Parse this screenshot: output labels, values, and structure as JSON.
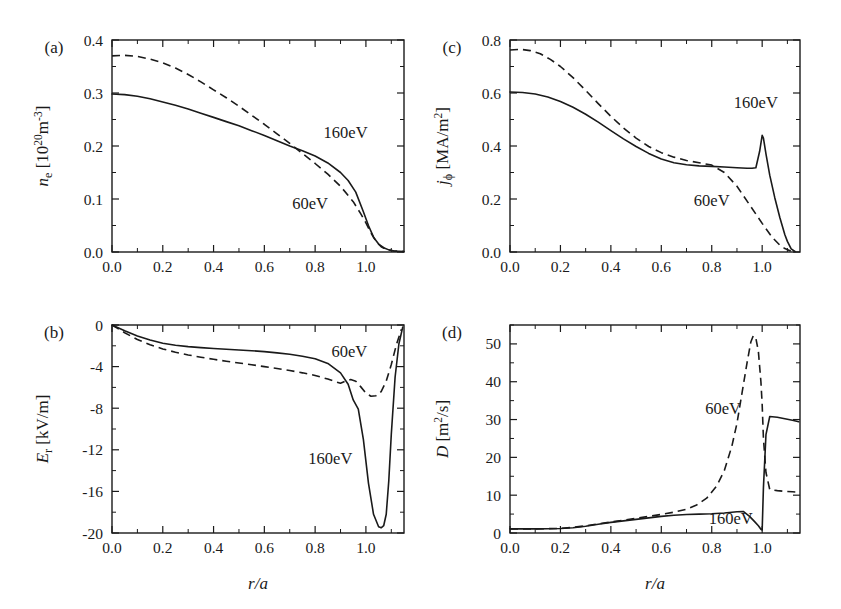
{
  "figure": {
    "panels": [
      {
        "id": "a",
        "letter": "(a)",
        "ylabel_main": "n",
        "ylabel_sub": "e",
        "ylabel_unit": " [10",
        "ylabel_unit_sup1": "20",
        "ylabel_unit_mid": "m",
        "ylabel_unit_sup2": "-3",
        "ylabel_unit_end": "]",
        "xlabel": "",
        "yticks": [
          "0.0",
          "0.1",
          "0.2",
          "0.3",
          "0.4"
        ],
        "xticks": [
          "0.0",
          "0.2",
          "0.4",
          "0.6",
          "0.8",
          "1.0"
        ],
        "labels": [
          {
            "text": "160eV",
            "x": 0.92,
            "y": 0.215
          },
          {
            "text": "60eV",
            "x": 0.78,
            "y": 0.082
          }
        ]
      },
      {
        "id": "b",
        "letter": "(b)",
        "ylabel_main": "E",
        "ylabel_sub": "r",
        "ylabel_unit": " [kV/m]",
        "xlabel": "r/a",
        "yticks": [
          "-20",
          "-16",
          "-12",
          "-8",
          "-4",
          "0"
        ],
        "xticks": [
          "0.0",
          "0.2",
          "0.4",
          "0.6",
          "0.8",
          "1.0"
        ],
        "labels": [
          {
            "text": "60eV",
            "x": 0.935,
            "y": -3.1
          },
          {
            "text": "160eV",
            "x": 0.86,
            "y": -13.4
          }
        ]
      },
      {
        "id": "c",
        "letter": "(c)",
        "ylabel_main": "j",
        "ylabel_sub": "ϕ",
        "ylabel_unit": " [MA/m",
        "ylabel_unit_sup1": "2",
        "ylabel_unit_end": "]",
        "xlabel": "",
        "yticks": [
          "0.0",
          "0.2",
          "0.4",
          "0.6",
          "0.8"
        ],
        "xticks": [
          "0.0",
          "0.2",
          "0.4",
          "0.6",
          "0.8",
          "1.0"
        ],
        "labels": [
          {
            "text": "160eV",
            "x": 0.975,
            "y": 0.545
          },
          {
            "text": "60eV",
            "x": 0.8,
            "y": 0.175
          }
        ]
      },
      {
        "id": "d",
        "letter": "(d)",
        "ylabel_main": "D",
        "ylabel_sub": "",
        "ylabel_unit": " [m",
        "ylabel_unit_sup1": "2",
        "ylabel_unit_end": "/s]",
        "xlabel": "r/a",
        "yticks": [
          "0",
          "10",
          "20",
          "30",
          "40",
          "50"
        ],
        "xticks": [
          "0.0",
          "0.2",
          "0.4",
          "0.6",
          "0.8",
          "1.0"
        ],
        "labels": [
          {
            "text": "60eV",
            "x": 0.845,
            "y": 31.5
          },
          {
            "text": "160eV",
            "x": 0.875,
            "y": 2.4
          }
        ]
      }
    ]
  },
  "chart_data": [
    {
      "type": "line",
      "panel": "a",
      "title": "(a)",
      "xlabel": "r/a",
      "ylabel": "n_e [10^20 m^-3]",
      "xlim": [
        0.0,
        1.15
      ],
      "ylim": [
        0.0,
        0.4
      ],
      "xticks": [
        0.0,
        0.2,
        0.4,
        0.6,
        0.8,
        1.0
      ],
      "yticks": [
        0.0,
        0.1,
        0.2,
        0.3,
        0.4
      ],
      "grid": false,
      "legend": "inline-annotations",
      "series": [
        {
          "name": "160eV",
          "style": "solid",
          "x": [
            0.0,
            0.05,
            0.1,
            0.15,
            0.2,
            0.25,
            0.3,
            0.35,
            0.4,
            0.45,
            0.5,
            0.55,
            0.6,
            0.65,
            0.7,
            0.75,
            0.8,
            0.85,
            0.9,
            0.93,
            0.96,
            0.99,
            1.01,
            1.03,
            1.05,
            1.07,
            1.09,
            1.11,
            1.15
          ],
          "y": [
            0.298,
            0.297,
            0.294,
            0.289,
            0.283,
            0.277,
            0.27,
            0.262,
            0.254,
            0.246,
            0.238,
            0.229,
            0.22,
            0.21,
            0.2,
            0.191,
            0.181,
            0.168,
            0.15,
            0.135,
            0.113,
            0.076,
            0.05,
            0.028,
            0.015,
            0.008,
            0.004,
            0.002,
            0.001
          ]
        },
        {
          "name": "60eV",
          "style": "dashed",
          "x": [
            0.0,
            0.05,
            0.1,
            0.15,
            0.2,
            0.25,
            0.3,
            0.35,
            0.4,
            0.45,
            0.5,
            0.55,
            0.6,
            0.65,
            0.7,
            0.75,
            0.8,
            0.85,
            0.9,
            0.95,
            0.98,
            1.0,
            1.02,
            1.04,
            1.06,
            1.08,
            1.11,
            1.15
          ],
          "y": [
            0.37,
            0.371,
            0.369,
            0.364,
            0.357,
            0.347,
            0.335,
            0.321,
            0.306,
            0.291,
            0.275,
            0.258,
            0.241,
            0.223,
            0.205,
            0.186,
            0.167,
            0.147,
            0.124,
            0.095,
            0.072,
            0.055,
            0.036,
            0.02,
            0.01,
            0.005,
            0.002,
            0.001
          ]
        }
      ]
    },
    {
      "type": "line",
      "panel": "b",
      "title": "(b)",
      "xlabel": "r/a",
      "ylabel": "E_r [kV/m]",
      "xlim": [
        0.0,
        1.15
      ],
      "ylim": [
        -20,
        0
      ],
      "xticks": [
        0.0,
        0.2,
        0.4,
        0.6,
        0.8,
        1.0
      ],
      "yticks": [
        -20,
        -16,
        -12,
        -8,
        -4,
        0
      ],
      "grid": false,
      "legend": "inline-annotations",
      "series": [
        {
          "name": "160eV",
          "style": "solid",
          "x": [
            0.0,
            0.05,
            0.1,
            0.15,
            0.2,
            0.25,
            0.3,
            0.35,
            0.4,
            0.45,
            0.5,
            0.55,
            0.6,
            0.65,
            0.7,
            0.75,
            0.8,
            0.85,
            0.9,
            0.93,
            0.95,
            0.97,
            0.99,
            1.01,
            1.03,
            1.05,
            1.06,
            1.07,
            1.08,
            1.09,
            1.1,
            1.115,
            1.13,
            1.145
          ],
          "y": [
            0.0,
            -0.55,
            -1.05,
            -1.45,
            -1.75,
            -1.95,
            -2.08,
            -2.18,
            -2.26,
            -2.33,
            -2.4,
            -2.47,
            -2.56,
            -2.68,
            -2.82,
            -3.0,
            -3.25,
            -3.7,
            -4.6,
            -5.7,
            -7.2,
            -8.1,
            -11.0,
            -15.2,
            -18.2,
            -19.4,
            -19.5,
            -19.3,
            -18.2,
            -15.0,
            -10.5,
            -5.0,
            -1.8,
            -0.2
          ]
        },
        {
          "name": "60eV",
          "style": "dashed",
          "x": [
            0.0,
            0.05,
            0.1,
            0.15,
            0.2,
            0.25,
            0.3,
            0.35,
            0.4,
            0.45,
            0.5,
            0.55,
            0.6,
            0.65,
            0.7,
            0.75,
            0.8,
            0.85,
            0.88,
            0.9,
            0.92,
            0.94,
            0.96,
            0.98,
            1.0,
            1.02,
            1.04,
            1.06,
            1.08,
            1.1,
            1.12,
            1.14
          ],
          "y": [
            0.0,
            -0.75,
            -1.4,
            -1.9,
            -2.3,
            -2.62,
            -2.88,
            -3.1,
            -3.3,
            -3.48,
            -3.65,
            -3.82,
            -4.0,
            -4.18,
            -4.38,
            -4.6,
            -4.85,
            -5.2,
            -5.45,
            -5.6,
            -5.4,
            -5.25,
            -5.4,
            -5.95,
            -6.55,
            -6.85,
            -6.8,
            -6.4,
            -5.4,
            -3.8,
            -1.9,
            -0.4
          ]
        }
      ]
    },
    {
      "type": "line",
      "panel": "c",
      "title": "(c)",
      "xlabel": "r/a",
      "ylabel": "j_phi [MA/m^2]",
      "xlim": [
        0.0,
        1.15
      ],
      "ylim": [
        0.0,
        0.8
      ],
      "xticks": [
        0.0,
        0.2,
        0.4,
        0.6,
        0.8,
        1.0
      ],
      "yticks": [
        0.0,
        0.2,
        0.4,
        0.6,
        0.8
      ],
      "grid": false,
      "legend": "inline-annotations",
      "series": [
        {
          "name": "160eV",
          "style": "solid",
          "x": [
            0.0,
            0.05,
            0.1,
            0.15,
            0.2,
            0.25,
            0.3,
            0.35,
            0.4,
            0.45,
            0.5,
            0.55,
            0.6,
            0.65,
            0.7,
            0.75,
            0.8,
            0.85,
            0.9,
            0.94,
            0.96,
            0.975,
            0.99,
            1.0,
            1.005,
            1.015,
            1.03,
            1.05,
            1.07,
            1.09,
            1.1,
            1.115,
            1.13
          ],
          "y": [
            0.604,
            0.602,
            0.596,
            0.585,
            0.568,
            0.546,
            0.52,
            0.49,
            0.458,
            0.427,
            0.398,
            0.372,
            0.351,
            0.337,
            0.329,
            0.325,
            0.323,
            0.321,
            0.318,
            0.316,
            0.316,
            0.318,
            0.38,
            0.44,
            0.43,
            0.37,
            0.29,
            0.205,
            0.13,
            0.065,
            0.04,
            0.012,
            0.002
          ]
        },
        {
          "name": "60eV",
          "style": "dashed",
          "x": [
            0.0,
            0.04,
            0.08,
            0.12,
            0.16,
            0.2,
            0.25,
            0.3,
            0.35,
            0.4,
            0.45,
            0.5,
            0.55,
            0.6,
            0.65,
            0.7,
            0.75,
            0.8,
            0.85,
            0.9,
            0.95,
            1.0,
            1.04,
            1.07,
            1.09,
            1.11,
            1.13
          ],
          "y": [
            0.762,
            0.765,
            0.76,
            0.748,
            0.727,
            0.7,
            0.658,
            0.61,
            0.56,
            0.512,
            0.468,
            0.43,
            0.398,
            0.375,
            0.358,
            0.345,
            0.337,
            0.328,
            0.3,
            0.248,
            0.178,
            0.108,
            0.055,
            0.026,
            0.013,
            0.005,
            0.001
          ]
        }
      ]
    },
    {
      "type": "line",
      "panel": "d",
      "title": "(d)",
      "xlabel": "r/a",
      "ylabel": "D [m^2/s]",
      "xlim": [
        0.0,
        1.15
      ],
      "ylim": [
        0,
        55
      ],
      "xticks": [
        0.0,
        0.2,
        0.4,
        0.6,
        0.8,
        1.0
      ],
      "yticks": [
        0,
        10,
        20,
        30,
        40,
        50
      ],
      "grid": false,
      "legend": "inline-annotations",
      "series": [
        {
          "name": "160eV",
          "style": "solid",
          "x": [
            0.0,
            0.1,
            0.2,
            0.25,
            0.3,
            0.35,
            0.4,
            0.45,
            0.5,
            0.55,
            0.6,
            0.65,
            0.7,
            0.75,
            0.8,
            0.85,
            0.9,
            0.925,
            0.95,
            0.97,
            0.985,
            0.995,
            1.0,
            1.005,
            1.015,
            1.03,
            1.06,
            1.09,
            1.12,
            1.145
          ],
          "y": [
            1.1,
            1.1,
            1.2,
            1.4,
            1.8,
            2.3,
            2.8,
            3.2,
            3.6,
            4.0,
            4.4,
            4.7,
            4.9,
            5.0,
            5.1,
            5.3,
            5.6,
            5.7,
            4.4,
            3.0,
            1.9,
            1.0,
            0.8,
            12.0,
            26.0,
            30.8,
            30.6,
            30.2,
            29.8,
            29.4
          ]
        },
        {
          "name": "60eV",
          "style": "dashed",
          "x": [
            0.0,
            0.1,
            0.2,
            0.25,
            0.3,
            0.35,
            0.4,
            0.45,
            0.5,
            0.55,
            0.6,
            0.65,
            0.7,
            0.74,
            0.78,
            0.82,
            0.85,
            0.88,
            0.9,
            0.92,
            0.94,
            0.955,
            0.965,
            0.975,
            0.985,
            0.995,
            1.0,
            1.005,
            1.015,
            1.03,
            1.06,
            1.09,
            1.12,
            1.145
          ],
          "y": [
            1.1,
            1.1,
            1.2,
            1.5,
            1.9,
            2.4,
            2.9,
            3.4,
            3.9,
            4.4,
            4.9,
            5.5,
            6.3,
            7.4,
            9.2,
            12.5,
            16.5,
            23.0,
            29.0,
            37.0,
            45.0,
            50.5,
            52.2,
            51.5,
            48.0,
            40.0,
            34.0,
            25.0,
            16.0,
            11.5,
            11.2,
            11.0,
            10.9,
            10.8
          ]
        }
      ]
    }
  ]
}
